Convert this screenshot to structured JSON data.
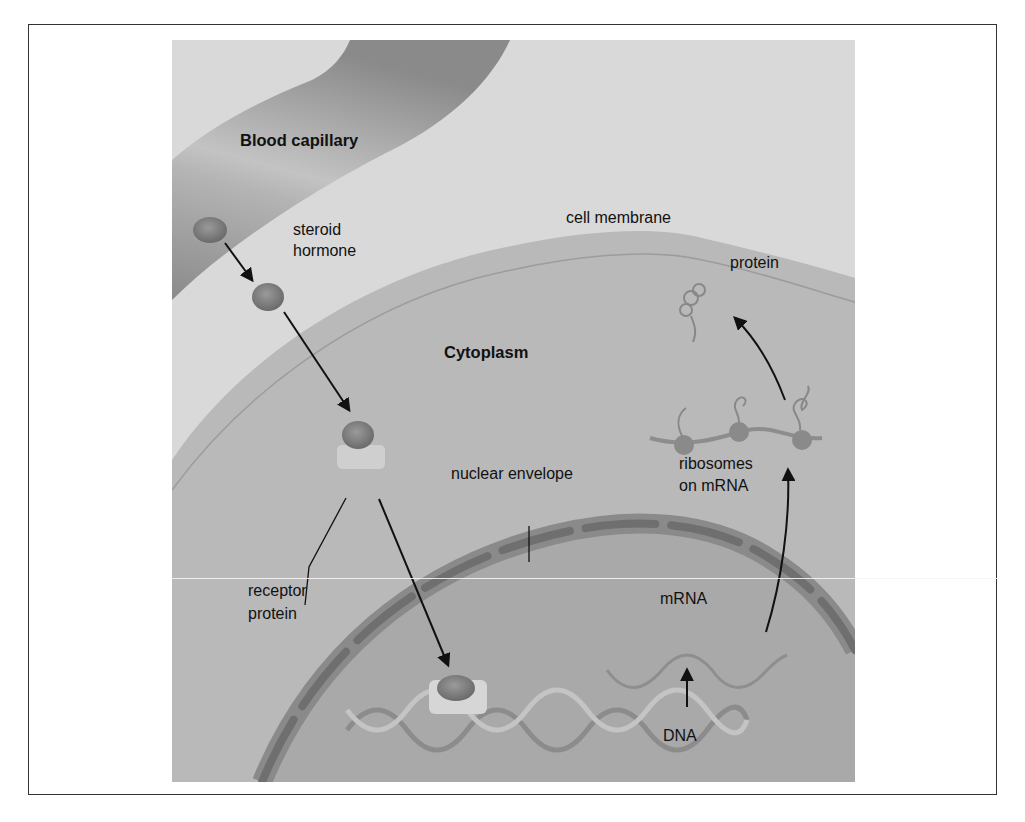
{
  "figure": {
    "labels": {
      "blood_capillary": "Blood capillary",
      "steroid_hormone": "steroid hormone",
      "steroid_line1": "steroid",
      "steroid_line2": "hormone",
      "cell_membrane": "cell membrane",
      "protein": "protein",
      "cytoplasm": "Cytoplasm",
      "ribosomes_line1": "ribosomes",
      "ribosomes_line2": "on mRNA",
      "nuclear_envelope": "nuclear envelope",
      "receptor_line1": "receptor",
      "receptor_line2": "protein",
      "mrna": "mRNA",
      "dna": "DNA"
    },
    "colors": {
      "background": "#dadada",
      "capillary": "#8f8f8f",
      "cytoplasm": "#b8b8b8",
      "nucleus": "#a8a8a8",
      "envelope": "#7e7e7e",
      "hormone": "#7a7a7a",
      "arrow": "#111111",
      "frame": "#333333"
    }
  }
}
